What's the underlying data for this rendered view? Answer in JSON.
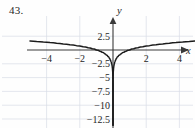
{
  "figure": {
    "exercise_number": "43.",
    "background_color": "#fefefe",
    "curve_color": "#1b1b1b",
    "axis_color": "#3a3a3a",
    "grid_color": "#d8dce6"
  },
  "chart_data": {
    "type": "line",
    "title": "",
    "subtitle": "",
    "xlabel": "x",
    "ylabel": "y",
    "xlim": [
      -5.8,
      5.6
    ],
    "ylim": [
      -14.2,
      3.6
    ],
    "grid": true,
    "legend": null,
    "x_ticks": [
      -4,
      -2,
      2,
      4
    ],
    "x_tick_labels": [
      "-4",
      "-2",
      "2",
      "4"
    ],
    "y_ticks": [
      2.5,
      -2.5,
      -5,
      -7.5,
      -10,
      -12.5
    ],
    "y_tick_labels": [
      "2.5",
      "-2.5",
      "-5",
      "-7.5",
      "-10",
      "-12.5"
    ],
    "x_gridlines": [
      -4,
      -2,
      2,
      4
    ],
    "y_gridlines": [
      2.5,
      -2.5,
      -5,
      -7.5,
      -10,
      -12.5
    ],
    "asymptote": {
      "type": "vertical",
      "x": 0
    },
    "axis_arrows": {
      "x_right": true,
      "y_up": true
    },
    "series": [
      {
        "name": "y = ln|x|",
        "branch": "left",
        "points": [
          [
            -5.0,
            1.61
          ],
          [
            -4.6,
            1.53
          ],
          [
            -4.2,
            1.44
          ],
          [
            -3.8,
            1.34
          ],
          [
            -3.4,
            1.22
          ],
          [
            -3.0,
            1.1
          ],
          [
            -2.6,
            0.96
          ],
          [
            -2.2,
            0.79
          ],
          [
            -1.8,
            0.59
          ],
          [
            -1.5,
            0.41
          ],
          [
            -1.25,
            0.22
          ],
          [
            -1.0,
            0.0
          ],
          [
            -0.8,
            -0.22
          ],
          [
            -0.65,
            -0.43
          ],
          [
            -0.5,
            -0.69
          ],
          [
            -0.4,
            -0.92
          ],
          [
            -0.3,
            -1.2
          ],
          [
            -0.22,
            -1.51
          ],
          [
            -0.16,
            -1.83
          ],
          [
            -0.12,
            -2.12
          ],
          [
            -0.085,
            -2.47
          ],
          [
            -0.06,
            -2.81
          ],
          [
            -0.04,
            -3.22
          ],
          [
            -0.025,
            -3.69
          ],
          [
            -0.015,
            -4.2
          ],
          [
            -0.009,
            -4.71
          ],
          [
            -0.005,
            -5.3
          ],
          [
            -0.0025,
            -5.99
          ],
          [
            -0.001,
            -6.91
          ],
          [
            -0.0004,
            -7.82
          ],
          [
            -0.00012,
            -9.03
          ],
          [
            -3e-05,
            -10.41
          ],
          [
            -6e-06,
            -12.02
          ],
          [
            -1.2e-06,
            -13.63
          ]
        ]
      },
      {
        "name": "y = ln|x|",
        "branch": "right",
        "points": [
          [
            5.0,
            1.61
          ],
          [
            4.6,
            1.53
          ],
          [
            4.2,
            1.44
          ],
          [
            3.8,
            1.34
          ],
          [
            3.4,
            1.22
          ],
          [
            3.0,
            1.1
          ],
          [
            2.6,
            0.96
          ],
          [
            2.2,
            0.79
          ],
          [
            1.8,
            0.59
          ],
          [
            1.5,
            0.41
          ],
          [
            1.25,
            0.22
          ],
          [
            1.0,
            0.0
          ],
          [
            0.8,
            -0.22
          ],
          [
            0.65,
            -0.43
          ],
          [
            0.5,
            -0.69
          ],
          [
            0.4,
            -0.92
          ],
          [
            0.3,
            -1.2
          ],
          [
            0.22,
            -1.51
          ],
          [
            0.16,
            -1.83
          ],
          [
            0.12,
            -2.12
          ],
          [
            0.085,
            -2.47
          ],
          [
            0.06,
            -2.81
          ],
          [
            0.04,
            -3.22
          ],
          [
            0.025,
            -3.69
          ],
          [
            0.015,
            -4.2
          ],
          [
            0.009,
            -4.71
          ],
          [
            0.005,
            -5.3
          ],
          [
            0.0025,
            -5.99
          ],
          [
            0.001,
            -6.91
          ],
          [
            0.0004,
            -7.82
          ],
          [
            0.00012,
            -9.03
          ],
          [
            3e-05,
            -10.41
          ],
          [
            6e-06,
            -12.02
          ],
          [
            1.2e-06,
            -13.63
          ]
        ]
      }
    ]
  }
}
